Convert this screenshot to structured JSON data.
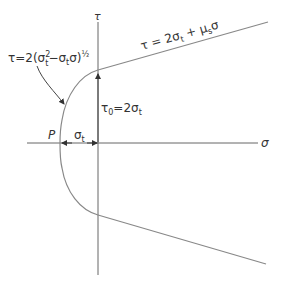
{
  "diagram": {
    "type": "mohr-failure-envelope",
    "axes": {
      "vertical_label": "τ",
      "horizontal_label": "σ"
    },
    "labels": {
      "curve_equation": {
        "prefix": "τ=2(σ",
        "sup": "2",
        "sub1": "t",
        "mid": "−σ",
        "sub2": "t",
        "tail": "σ)",
        "exp": "½"
      },
      "line_equation": {
        "prefix": "τ = 2σ",
        "sub": "t",
        "mid": " + μ",
        "sub2": "s",
        "tail": "σ"
      },
      "intercept": {
        "prefix": "τ",
        "sub0": "0",
        "mid": "=2σ",
        "sub": "t"
      },
      "point_P": "P",
      "sigma_t": {
        "main": "σ",
        "sub": "t"
      }
    },
    "colors": {
      "line": "#777777",
      "text": "#333333"
    }
  }
}
